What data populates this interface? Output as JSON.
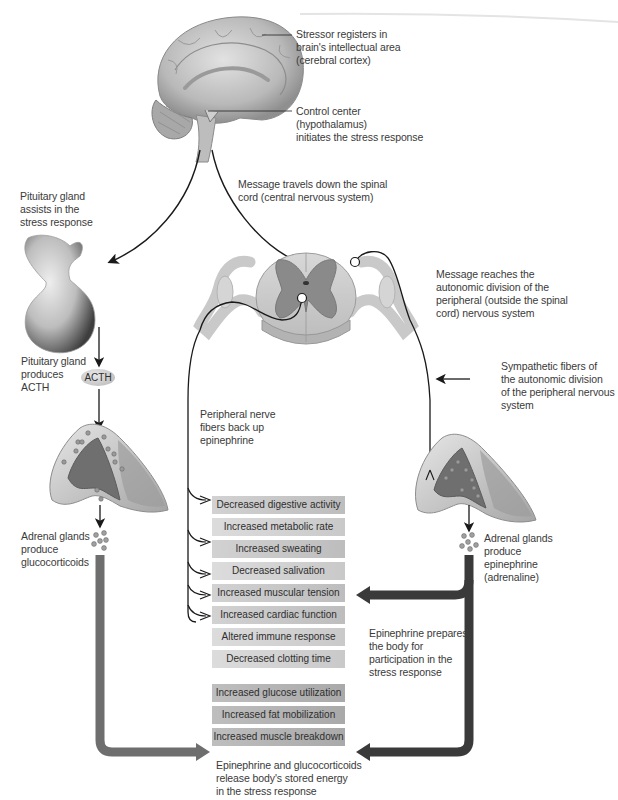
{
  "labels": {
    "stressor": [
      "Stressor registers in",
      "brain's intellectual area",
      "(cerebral cortex)"
    ],
    "control_center": [
      "Control center",
      "(hypothalamus)",
      "initiates the stress response"
    ],
    "message_spinal": [
      "Message travels down the spinal",
      "cord (central nervous system)"
    ],
    "pituitary_assists": [
      "Pituitary gland",
      "assists in the",
      "stress response"
    ],
    "pituitary_produces": [
      "Pituitary gland",
      "produces",
      "ACTH"
    ],
    "acth_badge": "ACTH",
    "message_reaches": [
      "Message reaches the",
      "autonomic division of the",
      "peripheral (outside the spinal",
      "cord) nervous system"
    ],
    "sympathetic_fibers": [
      "Sympathetic fibers of",
      "the autonomic division",
      "of the peripheral nervous",
      "system"
    ],
    "peripheral_fibers": [
      "Peripheral nerve",
      "fibers back up",
      "epinephrine"
    ],
    "adrenal_gluco": [
      "Adrenal glands",
      "produce",
      "glucocorticoids"
    ],
    "adrenal_epi": [
      "Adrenal glands",
      "produce",
      "epinephrine",
      "(adrenaline)"
    ],
    "epi_prepares": [
      "Epinephrine prepares",
      "the body for",
      "participation in the",
      "stress response"
    ],
    "energy_release": [
      "Epinephrine and glucocorticoids",
      "release body's stored energy",
      "in the stress response"
    ]
  },
  "effects_upper": [
    "Decreased digestive activity",
    "Increased metabolic rate",
    "Increased sweating",
    "Decreased salivation",
    "Increased muscular tension",
    "Increased cardiac function",
    "Altered immune response",
    "Decreased clotting time"
  ],
  "effects_lower": [
    "Increased glucose utilization",
    "Increased fat mobilization",
    "Increased muscle breakdown"
  ],
  "colors": {
    "box_fill": "#c6c6c6",
    "thick_arrow_gluco": "#6e6e6e",
    "thick_arrow_epi": "#3a3a3a",
    "nerve_line": "#1a1a1a",
    "grey_matter": "#8a8a8a",
    "white_matter": "#cfcfcf"
  }
}
